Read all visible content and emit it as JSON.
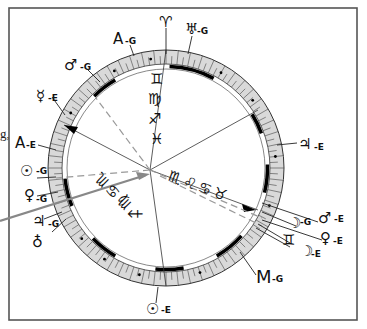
{
  "figure": {
    "type": "astrological-chart-wheel",
    "frame_color": "#555555",
    "ring_fill": "#d9d9d9",
    "ink_color": "#111111",
    "gray_line_color": "#8a8a8a"
  },
  "edge_fragment": {
    "text": "g,"
  },
  "top_marker": {
    "glyph": "♈",
    "name": "Aries"
  },
  "outer_labels": [
    {
      "id": "a-g",
      "glyph": "A",
      "suffix": "-G"
    },
    {
      "id": "uranus-g",
      "glyph": "♅",
      "suffix": "-G"
    },
    {
      "id": "mars-g",
      "glyph": "♂",
      "suffix": "-G"
    },
    {
      "id": "mercury-e",
      "glyph": "☿",
      "suffix": "-E"
    },
    {
      "id": "a-e",
      "glyph": "A",
      "suffix": "-E"
    },
    {
      "id": "sun-g",
      "glyph": "☉",
      "suffix": "-G"
    },
    {
      "id": "venus-g",
      "glyph": "♀",
      "suffix": "-G"
    },
    {
      "id": "jupiter-g",
      "glyph": "♃",
      "suffix": "-G"
    },
    {
      "id": "earth-g",
      "glyph": "♁",
      "suffix": ""
    },
    {
      "id": "jupiter-e",
      "glyph": "♃",
      "suffix": "-E"
    },
    {
      "id": "mars-e",
      "glyph": "♂",
      "suffix": "-E"
    },
    {
      "id": "moon-g",
      "glyph": "☽",
      "suffix": "-G"
    },
    {
      "id": "venus-e",
      "glyph": "♀",
      "suffix": "-E"
    },
    {
      "id": "gemini-right",
      "glyph": "♊",
      "suffix": ""
    },
    {
      "id": "moon-e",
      "glyph": "☽",
      "suffix": "-E"
    },
    {
      "id": "m-g",
      "glyph": "M",
      "suffix": "-G"
    },
    {
      "id": "sun-e",
      "glyph": "☉",
      "suffix": "-E"
    }
  ],
  "inner_glyph_stack_top": [
    "♊",
    "♍",
    "♐",
    "♓"
  ],
  "inner_glyph_stack_left": [
    "♐",
    "♍",
    "♋",
    "♏"
  ],
  "inner_glyph_stack_right": [
    "♏",
    "♌",
    "♋",
    "♉"
  ]
}
